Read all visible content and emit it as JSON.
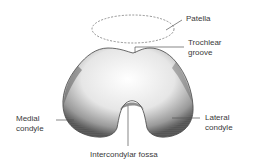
{
  "diagram": {
    "labels": {
      "patella": "Patella",
      "trochlear_1": "Trochlear",
      "trochlear_2": "groove",
      "medial_1": "Medial",
      "medial_2": "condyle",
      "lateral_1": "Lateral",
      "lateral_2": "condyle",
      "fossa": "Intercondylar fossa"
    },
    "colors": {
      "line": "#555555",
      "bone_shadow": "#6a6a6a",
      "bone_fill": "#f2f2f2"
    }
  }
}
